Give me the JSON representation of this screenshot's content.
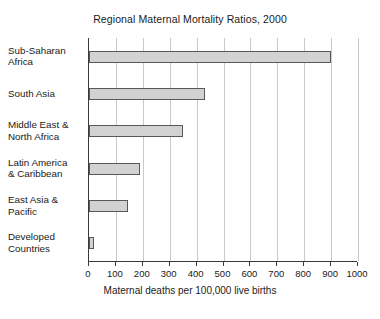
{
  "chart_data": {
    "type": "bar",
    "orientation": "horizontal",
    "title": "Regional Maternal Mortality Ratios, 2000",
    "xlabel": "Maternal deaths per 100,000 live births",
    "ylabel": "",
    "xlim": [
      0,
      1000
    ],
    "xticks": [
      0,
      100,
      200,
      300,
      400,
      500,
      600,
      700,
      800,
      900,
      1000
    ],
    "xtick_labels": [
      "0",
      "100",
      "200",
      "300",
      "400",
      "500",
      "600",
      "700",
      "800",
      "900",
      "1000"
    ],
    "grid": "vertical",
    "legend": "none",
    "categories": [
      "Sub-Saharan Africa",
      "South Asia",
      "Middle East & North Africa",
      "Latin America & Caribbean",
      "East Asia & Pacific",
      "Developed Countries"
    ],
    "category_lines": [
      [
        "Sub-Saharan",
        "Africa"
      ],
      [
        "South Asia",
        ""
      ],
      [
        "Middle East &",
        "North Africa"
      ],
      [
        "Latin America",
        "& Caribbean"
      ],
      [
        "East Asia &",
        "Pacific"
      ],
      [
        "Developed",
        "Countries"
      ]
    ],
    "values": [
      900,
      430,
      350,
      190,
      145,
      20
    ],
    "bar_fill_color": "#d2d2d2",
    "bar_edge_color": "#585858",
    "grid_color": "#c9c9c9",
    "axis_color": "#3a3a3a"
  }
}
